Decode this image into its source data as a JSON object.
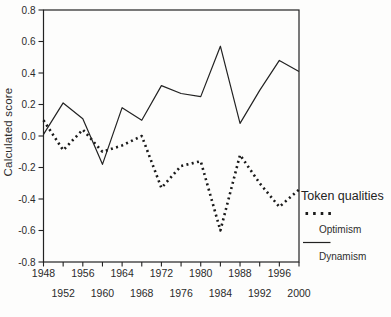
{
  "figure": {
    "background": "#fdfdfc",
    "line_color": "#222222",
    "text_color": "#2b2b2b"
  },
  "y_axis": {
    "title": "Calculated score",
    "tick_labels": [
      "0.8",
      "0.6",
      "0.4",
      "0.2",
      "0.0",
      "-0.2",
      "-0.4",
      "-0.6",
      "-0.8"
    ],
    "tick_values": [
      0.8,
      0.6,
      0.4,
      0.2,
      0.0,
      -0.2,
      -0.4,
      -0.6,
      -0.8
    ]
  },
  "x_axis": {
    "row1_labels": [
      "1948",
      "1956",
      "1964",
      "1972",
      "1980",
      "1988",
      "1996"
    ],
    "row2_labels": [
      "1952",
      "1960",
      "1968",
      "1976",
      "1984",
      "1992",
      "2000"
    ]
  },
  "legend": {
    "title": "Token qualities",
    "entries": [
      {
        "label": "Optimism",
        "style": "dotted"
      },
      {
        "label": "Dynamism",
        "style": "solid"
      }
    ]
  },
  "chart_data": {
    "type": "line",
    "title": "",
    "xlabel": "",
    "ylabel": "Calculated score",
    "xlim": [
      1948,
      2000
    ],
    "ylim": [
      -0.8,
      0.8
    ],
    "grid": false,
    "legend_position": "right",
    "legend_title": "Token qualities",
    "x": [
      1948,
      1952,
      1956,
      1960,
      1964,
      1968,
      1972,
      1976,
      1980,
      1984,
      1988,
      1992,
      1996,
      2000
    ],
    "series": [
      {
        "name": "Optimism",
        "style": "dotted",
        "values": [
          0.1,
          -0.09,
          0.04,
          -0.1,
          -0.06,
          0.0,
          -0.33,
          -0.19,
          -0.16,
          -0.6,
          -0.12,
          -0.3,
          -0.45,
          -0.34
        ]
      },
      {
        "name": "Dynamism",
        "style": "solid",
        "values": [
          0.01,
          0.21,
          0.11,
          -0.18,
          0.18,
          0.1,
          0.32,
          0.27,
          0.25,
          0.57,
          0.08,
          0.29,
          0.48,
          0.41
        ]
      }
    ]
  }
}
